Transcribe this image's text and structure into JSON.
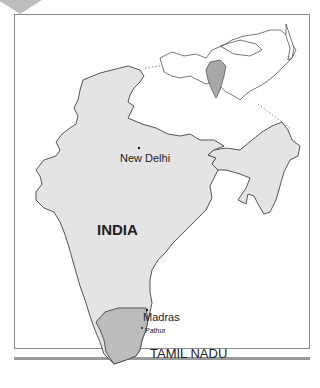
{
  "map": {
    "country_label": "INDIA",
    "highlighted_region_label": "TAMIL NADU",
    "cities": [
      {
        "name": "New Delhi"
      },
      {
        "name": "Madras"
      },
      {
        "name": "Pathur"
      }
    ],
    "inset": {
      "description": "Asia locator map with India highlighted"
    },
    "colors": {
      "country_fill": "#e4e4e4",
      "region_fill": "#bcbcbc",
      "inset_highlight": "#a8a8a8",
      "outline": "#555555"
    }
  }
}
